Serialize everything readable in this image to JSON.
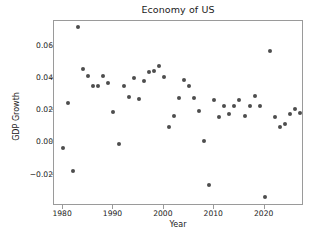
{
  "chart_data": {
    "type": "scatter",
    "title": "Economy of US",
    "xlabel": "Year",
    "ylabel": "GDP Growth",
    "xlim": [
      1978.2,
      2027.8
    ],
    "ylim": [
      -0.0395,
      0.0755
    ],
    "xticks": [
      1980,
      1990,
      2000,
      2010,
      2020
    ],
    "xtick_labels": [
      "1980",
      "1990",
      "2000",
      "2010",
      "2020"
    ],
    "yticks": [
      -0.02,
      0.0,
      0.02,
      0.04,
      0.06
    ],
    "ytick_labels": [
      "−0.02",
      "0.00",
      "0.02",
      "0.04",
      "0.06"
    ],
    "grid": false,
    "legend": null,
    "marker": {
      "shape": "circle",
      "color": "#4d4d4d",
      "size_px": 4
    },
    "series": [
      {
        "name": "GDP Growth",
        "x": [
          1980,
          1981,
          1982,
          1983,
          1984,
          1985,
          1986,
          1987,
          1988,
          1989,
          1990,
          1991,
          1992,
          1993,
          1994,
          1995,
          1996,
          1997,
          1998,
          1999,
          2000,
          2001,
          2002,
          2003,
          2004,
          2005,
          2006,
          2007,
          2008,
          2009,
          2010,
          2011,
          2012,
          2013,
          2014,
          2015,
          2016,
          2017,
          2018,
          2019,
          2020,
          2021,
          2022,
          2023,
          2024,
          2025,
          2026,
          2027
        ],
        "y": [
          -0.0035,
          0.0248,
          -0.0178,
          0.0717,
          0.0459,
          0.0416,
          0.0349,
          0.0348,
          0.0416,
          0.0368,
          0.0188,
          -0.001,
          0.0349,
          0.0281,
          0.04,
          0.0269,
          0.0379,
          0.0437,
          0.0443,
          0.0475,
          0.0408,
          0.0099,
          0.0167,
          0.0279,
          0.0388,
          0.0348,
          0.0278,
          0.0197,
          0.0006,
          -0.0262,
          0.0264,
          0.016,
          0.0228,
          0.0179,
          0.0228,
          0.0264,
          0.0167,
          0.0224,
          0.0288,
          0.0224,
          -0.034,
          0.057,
          0.0157,
          0.0098,
          0.0114,
          0.018,
          0.0207,
          0.0184
        ]
      }
    ]
  }
}
